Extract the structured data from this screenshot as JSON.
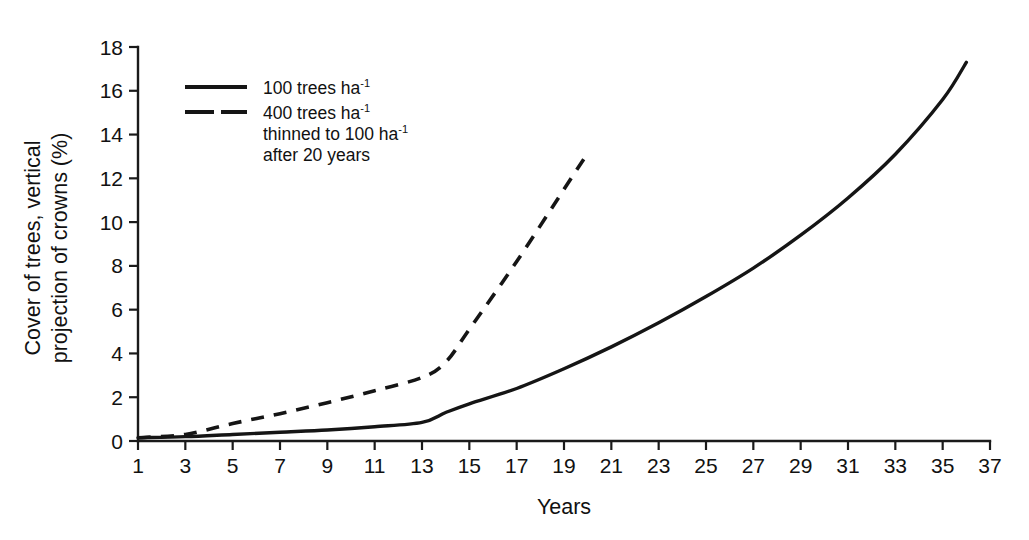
{
  "chart_data": {
    "type": "line",
    "title": "",
    "xlabel": "Years",
    "ylabel": "Cover of trees, vertical projection of crowns (%)",
    "xlim": [
      1,
      37
    ],
    "ylim": [
      0,
      18
    ],
    "grid": false,
    "legend_position": "top-left-inside",
    "x_ticks": [
      1,
      3,
      5,
      7,
      9,
      11,
      13,
      15,
      17,
      19,
      21,
      23,
      25,
      27,
      29,
      31,
      33,
      35,
      37
    ],
    "y_ticks": [
      0,
      2,
      4,
      6,
      8,
      10,
      12,
      14,
      16,
      18
    ],
    "series": [
      {
        "name": "100 trees ha-1",
        "style": "solid",
        "x": [
          1,
          3,
          5,
          7,
          9,
          11,
          13,
          14,
          15,
          17,
          19,
          21,
          23,
          25,
          27,
          29,
          31,
          33,
          35,
          36
        ],
        "values": [
          0.15,
          0.2,
          0.3,
          0.4,
          0.5,
          0.65,
          0.85,
          1.3,
          1.7,
          2.4,
          3.3,
          4.3,
          5.4,
          6.6,
          7.9,
          9.4,
          11.1,
          13.1,
          15.6,
          17.3
        ]
      },
      {
        "name": "400 trees ha-1 thinned to 100 ha-1 after 20 years",
        "style": "dashed",
        "x": [
          1,
          3,
          5,
          7,
          9,
          11,
          13,
          14,
          15,
          17,
          19,
          20,
          20.9
        ],
        "values": [
          0.15,
          0.3,
          0.8,
          1.25,
          1.75,
          2.3,
          2.9,
          3.6,
          5.1,
          8.2,
          11.5,
          13.15,
          4.6
        ]
      }
    ],
    "annotations": [
      {
        "label": "thinning drop",
        "x": 20,
        "y_from": 13.15,
        "y_to": 4.6
      }
    ]
  },
  "legend": {
    "entries": [
      {
        "swatch": "solid-line-swatch",
        "line1": "100 trees ha",
        "sup1": "-1",
        "line2": "",
        "line3": ""
      },
      {
        "swatch": "dashed-line-swatch",
        "line1": "400 trees ha",
        "sup1": "-1",
        "line2": "thinned to 100 ha",
        "sup2": "-1",
        "line3": "after 20 years"
      }
    ]
  },
  "axes": {
    "x_title": "Years",
    "y_title_line1": "Cover of trees, vertical",
    "y_title_line2": "projection of crowns (%)"
  },
  "colors": {
    "ink": "#151515",
    "background": "#ffffff"
  },
  "caption": {
    "partial_text": ""
  }
}
